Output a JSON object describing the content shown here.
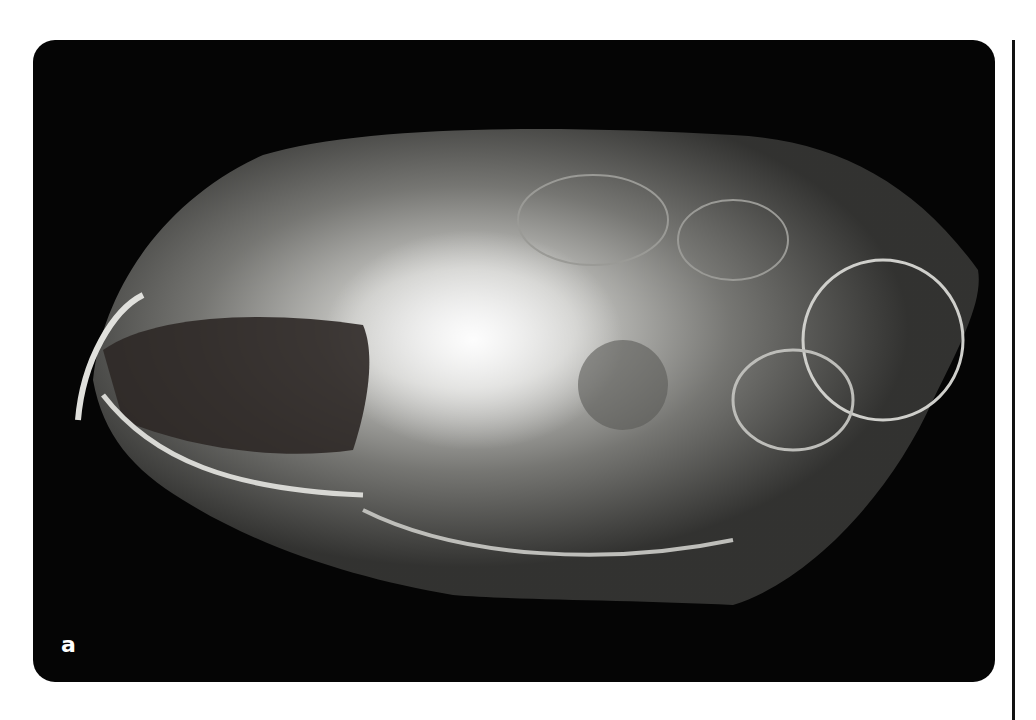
{
  "figure": {
    "panel_label": "a",
    "colors": {
      "background": "#050505",
      "bone_bright": "#f4f4f0",
      "bone_mid": "#9a9a96",
      "page": "#ffffff"
    }
  }
}
